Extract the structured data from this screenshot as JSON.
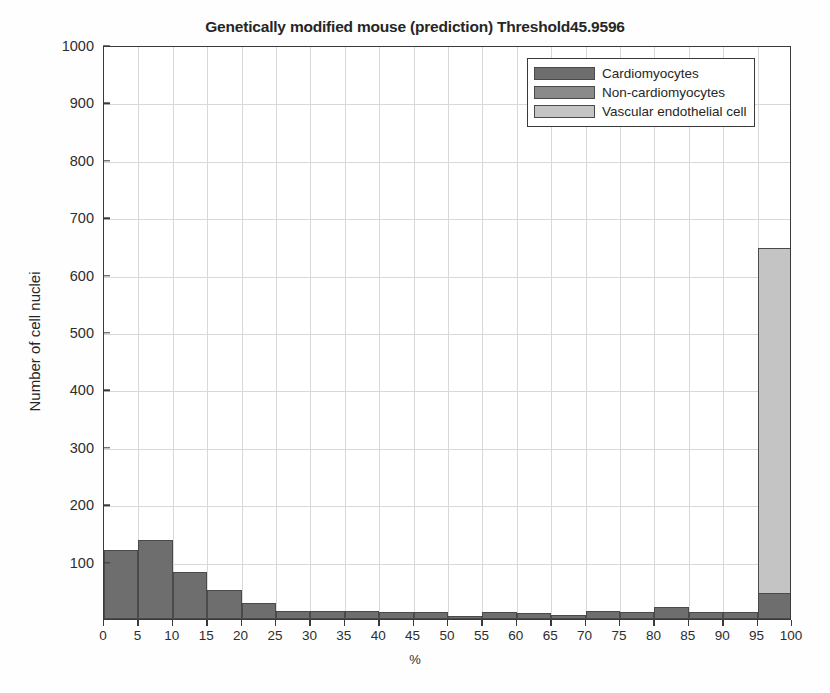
{
  "chart_data": {
    "type": "bar",
    "title": "Genetically modified mouse (prediction) Threshold45.9596",
    "subtitle": "",
    "xlabel": "%",
    "ylabel": "Number of cell nuclei",
    "xlim": [
      0,
      100
    ],
    "ylim": [
      0,
      1000
    ],
    "grid": true,
    "legend_position": "top-right",
    "stacked": true,
    "bin_width": 5,
    "x_tick_labels": [
      "0",
      "5",
      "10",
      "15",
      "20",
      "25",
      "30",
      "35",
      "40",
      "45",
      "50",
      "55",
      "60",
      "65",
      "70",
      "75",
      "80",
      "85",
      "90",
      "95",
      "100"
    ],
    "x_ticks": [
      0,
      5,
      10,
      15,
      20,
      25,
      30,
      35,
      40,
      45,
      50,
      55,
      60,
      65,
      70,
      75,
      80,
      85,
      90,
      95,
      100
    ],
    "y_tick_labels": [
      "100",
      "200",
      "300",
      "400",
      "500",
      "600",
      "700",
      "800",
      "900",
      "1000"
    ],
    "y_ticks": [
      100,
      200,
      300,
      400,
      500,
      600,
      700,
      800,
      900,
      1000
    ],
    "bin_starts": [
      0,
      5,
      10,
      15,
      20,
      25,
      30,
      35,
      40,
      45,
      50,
      55,
      60,
      65,
      70,
      75,
      80,
      85,
      90,
      95
    ],
    "categories": [
      "0-5",
      "5-10",
      "10-15",
      "15-20",
      "20-25",
      "25-30",
      "30-35",
      "35-40",
      "40-45",
      "45-50",
      "50-55",
      "55-60",
      "60-65",
      "65-70",
      "70-75",
      "75-80",
      "80-85",
      "85-90",
      "90-95",
      "95-100"
    ],
    "series": [
      {
        "name": "Cardiomyocytes",
        "color": "#6e6e6e",
        "values": [
          120,
          138,
          82,
          50,
          28,
          14,
          14,
          14,
          13,
          13,
          6,
          13,
          10,
          7,
          14,
          13,
          21,
          13,
          13,
          45
        ]
      },
      {
        "name": "Non-cardiomyocytes",
        "color": "#8a8a8a",
        "values": [
          0,
          0,
          0,
          0,
          0,
          0,
          0,
          0,
          0,
          0,
          0,
          0,
          0,
          0,
          0,
          0,
          0,
          0,
          0,
          0
        ]
      },
      {
        "name": "Vascular endothelial cell",
        "color": "#c4c4c4",
        "values": [
          0,
          0,
          0,
          0,
          0,
          0,
          0,
          0,
          0,
          0,
          0,
          0,
          0,
          0,
          0,
          0,
          0,
          0,
          0,
          603
        ]
      }
    ],
    "totals": [
      120,
      138,
      82,
      50,
      28,
      14,
      14,
      14,
      13,
      13,
      6,
      13,
      10,
      7,
      14,
      13,
      21,
      13,
      13,
      648
    ],
    "peak_bin": "95-100",
    "peak_value": 648
  },
  "legend": {
    "items": [
      {
        "label": "Cardiomyocytes",
        "color": "#6e6e6e"
      },
      {
        "label": "Non-cardiomyocytes",
        "color": "#8a8a8a"
      },
      {
        "label": "Vascular endothelial cell",
        "color": "#c4c4c4"
      }
    ]
  },
  "axes": {
    "title": "Genetically modified mouse (prediction) Threshold45.9596",
    "y_title": "Number of cell nuclei",
    "x_title": "%"
  },
  "colors": {
    "axis": "#3a3a3a",
    "grid": "#d8d8d8",
    "background": "#ffffff",
    "text": "#262626"
  }
}
